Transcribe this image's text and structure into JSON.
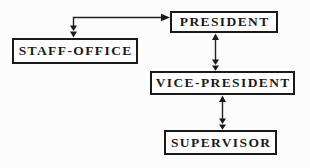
{
  "diagram": {
    "type": "org-chart",
    "background_color": "#fcfcfc",
    "ink_color": "#1a1a1a",
    "nodes": [
      {
        "id": "president",
        "label": "PRESIDENT"
      },
      {
        "id": "staff-office",
        "label": "STAFF-OFFICE"
      },
      {
        "id": "vice-president",
        "label": "VICE-PRESIDENT"
      },
      {
        "id": "supervisor",
        "label": "SUPERVISOR"
      }
    ],
    "edges": [
      {
        "from": "staff-office",
        "to": "president",
        "style": "elbow line; right arrowhead into PRESIDENT left side; double down arrowhead into STAFF-OFFICE top"
      },
      {
        "from": "president",
        "to": "vice-president",
        "style": "vertical; up arrowhead at PRESIDENT bottom; double down arrowhead at VICE-PRESIDENT top"
      },
      {
        "from": "vice-president",
        "to": "supervisor",
        "style": "vertical; up arrowhead at VICE-PRESIDENT bottom; double down arrowhead at SUPERVISOR top"
      }
    ]
  }
}
